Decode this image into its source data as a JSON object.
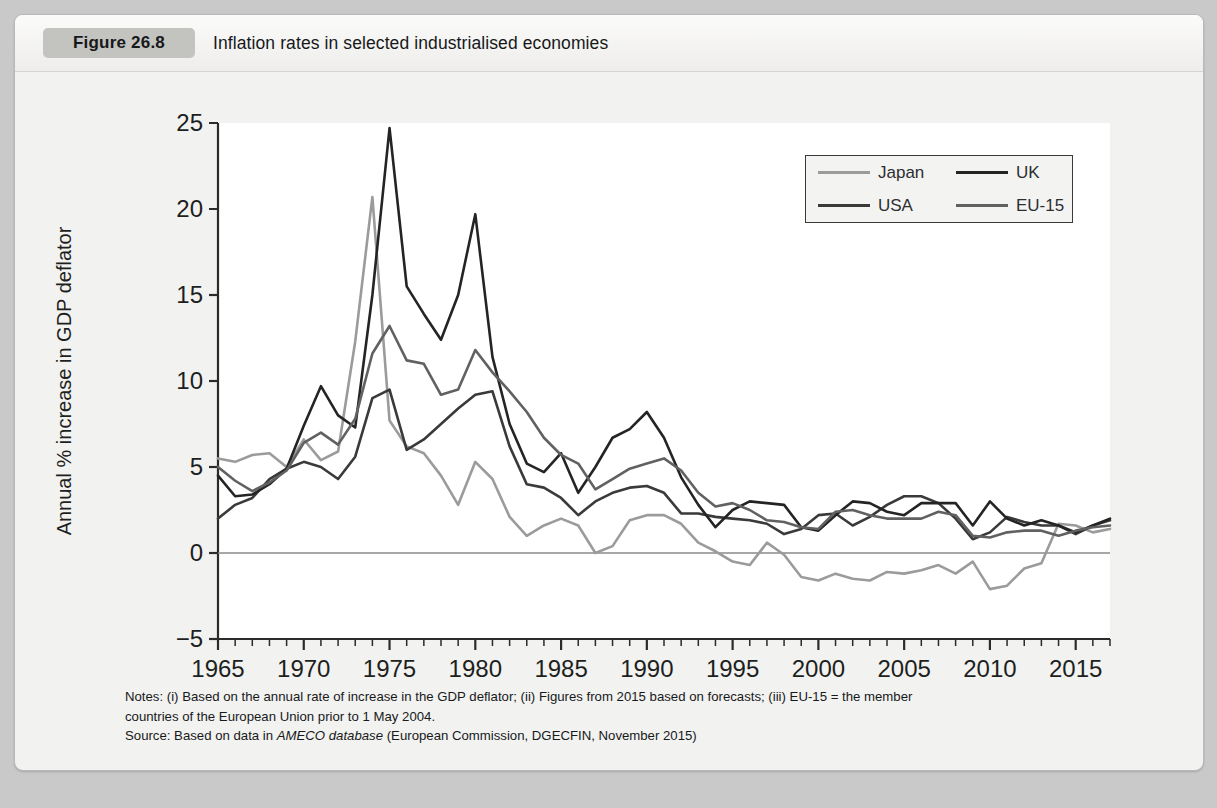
{
  "figure": {
    "badge": "Figure 26.8",
    "title": "Inflation rates in selected industrialised economies"
  },
  "notes": {
    "line1": "Notes: (i) Based on the annual rate of increase in the GDP deflator; (ii) Figures from 2015 based on forecasts; (iii) EU-15 = the member",
    "line2": "countries of the European Union prior to 1 May 2004.",
    "source_prefix": "Source: Based on data in ",
    "source_italic": "AMECO database",
    "source_suffix": " (European Commission, DGECFIN, November 2015)"
  },
  "colors": {
    "japan": "#9b9b9b",
    "usa": "#3a3a3a",
    "uk": "#242424",
    "eu15": "#616161",
    "axis": "#2b2b2b",
    "zero_line": "#8a8a8a",
    "plot_background": "#ffffff",
    "card_background": "#f2f2f0"
  },
  "chart_data": {
    "type": "line",
    "title": "Inflation rates in selected industrialised economies",
    "xlabel": "",
    "ylabel": "Annual % increase in GDP deflator",
    "xlim": [
      1965,
      2017
    ],
    "ylim": [
      -5,
      25
    ],
    "ytick_values": [
      -5,
      0,
      5,
      10,
      15,
      20,
      25
    ],
    "ytick_labels": [
      "−5",
      "0",
      "5",
      "10",
      "15",
      "20",
      "25"
    ],
    "xtick_labels": [
      "1965",
      "1970",
      "1975",
      "1980",
      "1985",
      "1990",
      "1995",
      "2000",
      "2005",
      "2010",
      "2015"
    ],
    "xtick_values": [
      1965,
      1970,
      1975,
      1980,
      1985,
      1990,
      1995,
      2000,
      2005,
      2010,
      2015
    ],
    "minor_tick_interval": 1,
    "grid": false,
    "zero_line": true,
    "legend_position": "upper right",
    "x": [
      1965,
      1966,
      1967,
      1968,
      1969,
      1970,
      1971,
      1972,
      1973,
      1974,
      1975,
      1976,
      1977,
      1978,
      1979,
      1980,
      1981,
      1982,
      1983,
      1984,
      1985,
      1986,
      1987,
      1988,
      1989,
      1990,
      1991,
      1992,
      1993,
      1994,
      1995,
      1996,
      1997,
      1998,
      1999,
      2000,
      2001,
      2002,
      2003,
      2004,
      2005,
      2006,
      2007,
      2008,
      2009,
      2010,
      2011,
      2012,
      2013,
      2014,
      2015,
      2016,
      2017
    ],
    "series": [
      {
        "name": "Japan",
        "color": "#9b9b9b",
        "values": [
          5.5,
          5.3,
          5.7,
          5.8,
          5.0,
          6.6,
          5.4,
          5.9,
          12.3,
          20.7,
          7.7,
          6.2,
          5.8,
          4.5,
          2.8,
          5.3,
          4.3,
          2.1,
          1.0,
          1.6,
          2.0,
          1.6,
          0.0,
          0.4,
          1.9,
          2.2,
          2.2,
          1.7,
          0.6,
          0.1,
          -0.5,
          -0.7,
          0.6,
          -0.1,
          -1.4,
          -1.6,
          -1.2,
          -1.5,
          -1.6,
          -1.1,
          -1.2,
          -1.0,
          -0.7,
          -1.2,
          -0.5,
          -2.1,
          -1.9,
          -0.9,
          -0.6,
          1.7,
          1.6,
          1.2,
          1.4
        ]
      },
      {
        "name": "USA",
        "color": "#3a3a3a",
        "values": [
          2.0,
          2.8,
          3.2,
          4.3,
          4.9,
          5.3,
          5.0,
          4.3,
          5.6,
          9.0,
          9.5,
          6.0,
          6.6,
          7.5,
          8.4,
          9.2,
          9.4,
          6.2,
          4.0,
          3.8,
          3.2,
          2.2,
          3.0,
          3.5,
          3.8,
          3.9,
          3.5,
          2.3,
          2.3,
          2.1,
          2.0,
          1.9,
          1.7,
          1.1,
          1.4,
          2.2,
          2.3,
          1.6,
          2.1,
          2.8,
          3.3,
          3.3,
          2.9,
          2.0,
          0.8,
          1.2,
          2.1,
          1.8,
          1.6,
          1.6,
          1.1,
          1.6,
          1.9
        ]
      },
      {
        "name": "UK",
        "color": "#242424",
        "values": [
          4.5,
          3.3,
          3.4,
          4.0,
          4.9,
          7.4,
          9.7,
          8.0,
          7.3,
          15.0,
          24.7,
          15.5,
          13.9,
          12.4,
          15.0,
          19.7,
          11.4,
          7.5,
          5.2,
          4.7,
          5.8,
          3.5,
          5.0,
          6.7,
          7.2,
          8.2,
          6.7,
          4.4,
          2.8,
          1.5,
          2.5,
          3.0,
          2.9,
          2.8,
          1.5,
          1.3,
          2.2,
          3.0,
          2.9,
          2.4,
          2.2,
          2.9,
          2.9,
          2.9,
          1.6,
          3.0,
          2.0,
          1.6,
          1.9,
          1.6,
          1.2,
          1.6,
          2.0
        ]
      },
      {
        "name": "EU-15",
        "color": "#616161",
        "values": [
          5.0,
          4.2,
          3.6,
          4.1,
          4.8,
          6.4,
          7.0,
          6.3,
          7.8,
          11.6,
          13.2,
          11.2,
          11.0,
          9.2,
          9.5,
          11.8,
          10.5,
          9.4,
          8.2,
          6.7,
          5.7,
          5.2,
          3.7,
          4.3,
          4.9,
          5.2,
          5.5,
          4.8,
          3.5,
          2.7,
          2.9,
          2.5,
          1.9,
          1.8,
          1.5,
          1.4,
          2.4,
          2.5,
          2.2,
          2.0,
          2.0,
          2.0,
          2.4,
          2.2,
          1.0,
          0.9,
          1.2,
          1.3,
          1.3,
          1.0,
          1.3,
          1.5,
          1.6
        ]
      }
    ]
  }
}
